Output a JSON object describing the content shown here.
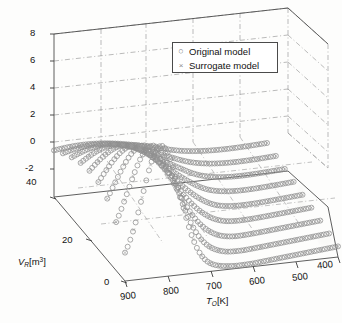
{
  "figure": {
    "title": "",
    "background_color": "#fdfdfc"
  },
  "legend": {
    "position": "top-right-inside",
    "border_color": "#4a4a4a",
    "entries": [
      {
        "label": "Original model",
        "marker": "circle",
        "marker_glyph": "○",
        "color": "#8c8c8c"
      },
      {
        "label": "Surrogate model",
        "marker": "cross",
        "marker_glyph": "×",
        "color": "#8a8a8a"
      }
    ]
  },
  "axes": {
    "z": {
      "title": "",
      "ticks": [
        "8",
        "6",
        "4",
        "2",
        "0",
        "-2"
      ],
      "values": [
        8,
        6,
        4,
        2,
        0,
        -2
      ],
      "range": [
        -2,
        8
      ]
    },
    "y": {
      "title_html": "V_R [m^3]",
      "title_var": "V",
      "title_sub": "R",
      "title_unit": "[m",
      "title_sup": "3",
      "title_unit_close": "]",
      "ticks": [
        "40",
        "20",
        "0"
      ],
      "values": [
        40,
        20,
        0
      ],
      "range": [
        0,
        40
      ]
    },
    "x": {
      "title_var": "T",
      "title_sub": "O",
      "title_unit": "[K]",
      "ticks": [
        "900",
        "800",
        "700",
        "600",
        "500",
        "400"
      ],
      "values": [
        900,
        800,
        700,
        600,
        500,
        400
      ],
      "range": [
        400,
        900
      ],
      "direction": "decreasing"
    }
  },
  "chart_data": {
    "type": "scatter",
    "title": "",
    "xlabel": "T_O [K]",
    "ylabel": "V_R [m^3]",
    "zlabel": "",
    "xlim": [
      400,
      900
    ],
    "ylim": [
      0,
      40
    ],
    "zlim": [
      -2,
      8
    ],
    "grid": true,
    "projection": "3d",
    "legend_position": "upper right",
    "series": [
      {
        "name": "Original model",
        "marker": "circle",
        "color": "#8c8c8c",
        "description": "Open gray circles sampled on a grid of T_O by V_R; response rises steeply to about 7 near T_O=800 K at low V_R and flattens near -1 to 1 for T_O below 600 K."
      },
      {
        "name": "Surrogate model",
        "marker": "cross",
        "color": "#8a8a8a",
        "description": "Small gray crosses overlaid on the same grid, coinciding with the original model markers."
      }
    ],
    "v_levels": [
      0,
      5,
      10,
      15,
      20,
      25,
      30,
      35,
      40
    ],
    "t_samples": [
      900,
      880,
      860,
      840,
      820,
      800,
      780,
      760,
      740,
      720,
      700,
      680,
      660,
      640,
      620,
      600,
      580,
      560,
      540,
      520,
      500,
      480,
      460,
      440,
      420,
      400
    ],
    "surface_note": "Ridge of high response near T_O ~ 800-820 K; monotonic decay toward T_O = 400 K."
  }
}
